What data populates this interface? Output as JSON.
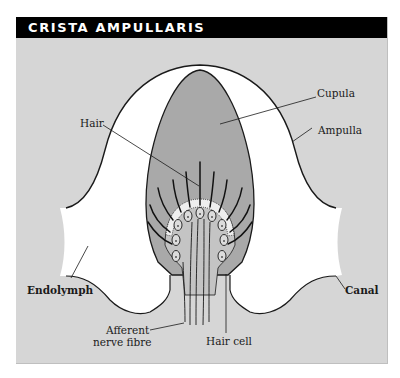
{
  "figure": {
    "title": "CRISTA AMPULLARIS",
    "colors": {
      "header_bg": "#000000",
      "header_text": "#ffffff",
      "panel_bg": "#d6d6d6",
      "endolymph": "#ffffff",
      "cupula": "#a9a9a9",
      "crista": "#c4c4c4",
      "outline": "#1a1a1a"
    },
    "labels": {
      "cupula": "Cupula",
      "ampulla": "Ampulla",
      "hair": "Hair",
      "endolymph": "Endolymph",
      "canal": "Canal",
      "afferent_line1": "Afferent",
      "afferent_line2": "nerve fibre",
      "hair_cell": "Hair cell"
    }
  }
}
